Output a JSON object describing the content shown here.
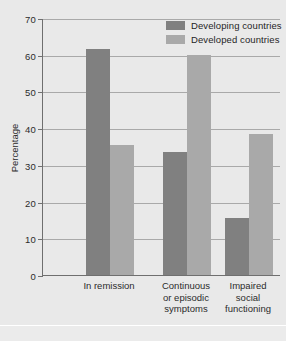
{
  "figure": {
    "background_color": "#e9e9e9",
    "caption_partial": ""
  },
  "legend": {
    "position": "top-right",
    "items": [
      {
        "label": "Developing countries",
        "color": "#808080",
        "swatch_name": "legend-swatch-developing"
      },
      {
        "label": "Developed countries",
        "color": "#a9a9a9",
        "swatch_name": "legend-swatch-developed"
      }
    ]
  },
  "axis": {
    "y_title": "Percentage",
    "y_ticks": [
      "0",
      "10",
      "20",
      "30",
      "40",
      "50",
      "60",
      "70"
    ]
  },
  "categories_display": [
    {
      "lines": [
        "In remission"
      ]
    },
    {
      "lines": [
        "Continuous",
        "or episodic",
        "symptoms"
      ]
    },
    {
      "lines": [
        "Impaired",
        "social",
        "functioning"
      ]
    }
  ],
  "chart_data": {
    "type": "bar",
    "title": "",
    "xlabel": "",
    "ylabel": "Percentage",
    "ylim": [
      0,
      70
    ],
    "ytick_interval": 10,
    "grid": true,
    "legend_position": "top-right",
    "categories": [
      "In remission",
      "Continuous or episodic symptoms",
      "Impaired social functioning"
    ],
    "series": [
      {
        "name": "Developing countries",
        "color": "#808080",
        "values": [
          61.5,
          33.5,
          15.5
        ]
      },
      {
        "name": "Developed countries",
        "color": "#a9a9a9",
        "values": [
          35.5,
          60.0,
          38.5
        ]
      }
    ]
  }
}
